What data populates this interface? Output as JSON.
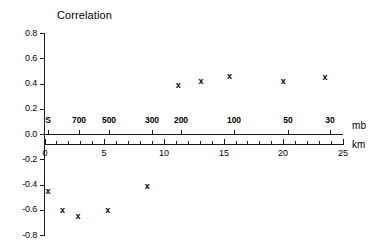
{
  "chart_data": {
    "type": "scatter",
    "title": "Correlation",
    "xlabel": "",
    "ylabel": "",
    "grid": false,
    "legend": null,
    "marker_symbol": "x",
    "ylim": [
      -0.8,
      0.8
    ],
    "yticks": [
      "0.8",
      "0.6",
      "0.4",
      "0.2",
      "0.0",
      "-0.2",
      "-0.4",
      "-0.6",
      "-0.8"
    ],
    "ytick_values": [
      0.8,
      0.6,
      0.4,
      0.2,
      0.0,
      -0.2,
      -0.4,
      -0.6,
      -0.8
    ],
    "axes": [
      {
        "name": "pressure",
        "unit": "mb",
        "position": "top-inner",
        "ticklabels": [
          "S",
          "700",
          "500",
          "300",
          "200",
          "100",
          "50",
          "30"
        ],
        "tick_km_positions": [
          0.3,
          2.9,
          5.4,
          9.0,
          11.4,
          15.9,
          20.4,
          23.9
        ]
      },
      {
        "name": "altitude",
        "unit": "km",
        "position": "bottom",
        "xlim": [
          0,
          25
        ],
        "ticklabels": [
          "0",
          "5",
          "10",
          "15",
          "20",
          "25"
        ],
        "tick_values": [
          0,
          5,
          10,
          15,
          20,
          25
        ],
        "minor_tick_values": [
          1,
          2,
          3,
          4,
          6,
          7,
          8,
          9,
          11,
          12,
          13,
          14,
          16,
          17,
          18,
          19,
          21,
          22,
          23,
          24
        ]
      }
    ],
    "x": [
      0.3,
      1.5,
      2.8,
      5.3,
      8.6,
      11.2,
      13.1,
      15.5,
      20.0,
      23.5
    ],
    "y": [
      -0.45,
      -0.6,
      -0.65,
      -0.6,
      -0.41,
      0.39,
      0.42,
      0.46,
      0.42,
      0.45
    ],
    "points": [
      {
        "x": 0.3,
        "y": -0.45
      },
      {
        "x": 1.5,
        "y": -0.6
      },
      {
        "x": 2.8,
        "y": -0.65
      },
      {
        "x": 5.3,
        "y": -0.6
      },
      {
        "x": 8.6,
        "y": -0.41
      },
      {
        "x": 11.2,
        "y": 0.39
      },
      {
        "x": 13.1,
        "y": 0.42
      },
      {
        "x": 15.5,
        "y": 0.46
      },
      {
        "x": 20.0,
        "y": 0.42
      },
      {
        "x": 23.5,
        "y": 0.45
      }
    ]
  },
  "labels": {
    "title": "Correlation",
    "mb_unit": "mb",
    "km_unit": "km"
  },
  "colors": {
    "ink": "#000000",
    "axis": "#1a1a1a",
    "background": "#ffffff"
  }
}
